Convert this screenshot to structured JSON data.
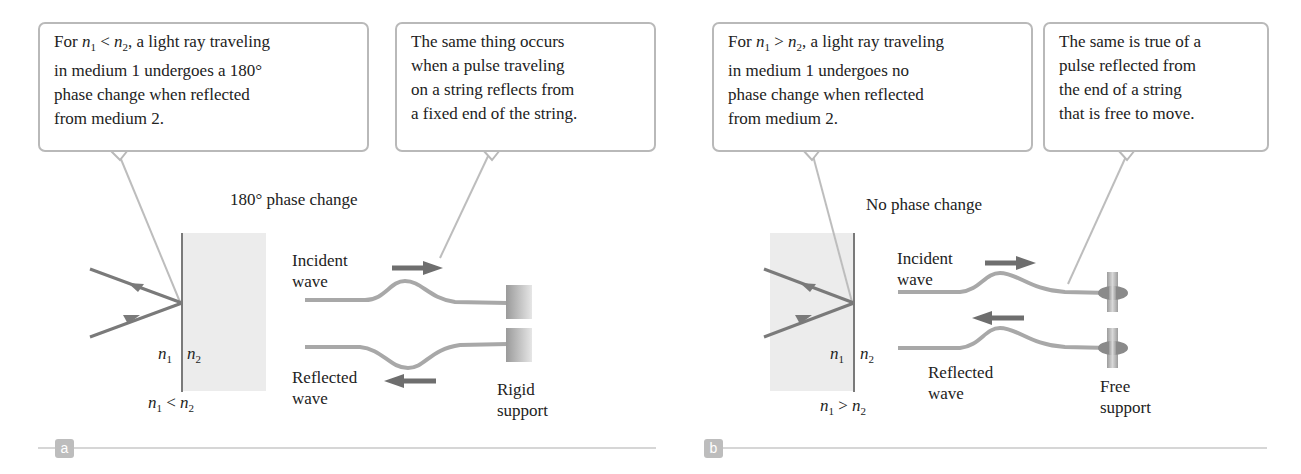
{
  "panel_a": {
    "badge": "a",
    "callout_light": {
      "lines": [
        {
          "pre": "For ",
          "n1": "n",
          "n1sub": "1",
          "op": " < ",
          "n2": "n",
          "n2sub": "2",
          "post": ", a light ray traveling"
        },
        "in medium 1 undergoes a 180°",
        "phase change when reflected",
        "from medium 2."
      ]
    },
    "callout_string": {
      "lines": [
        "The same thing occurs",
        "when a pulse traveling",
        "on a string reflects from",
        "a fixed end of the string."
      ]
    },
    "phase_label": "180° phase change",
    "incident_label": [
      "Incident",
      "wave"
    ],
    "reflected_label": [
      "Reflected",
      "wave"
    ],
    "support_label": [
      "Rigid",
      "support"
    ],
    "n_left": {
      "sym": "n",
      "sub": "1"
    },
    "n_right": {
      "sym": "n",
      "sub": "2"
    },
    "relation": {
      "a": "n",
      "asub": "1",
      "op": " < ",
      "b": "n",
      "bsub": "2"
    }
  },
  "panel_b": {
    "badge": "b",
    "callout_light": {
      "lines": [
        {
          "pre": "For ",
          "n1": "n",
          "n1sub": "1",
          "op": " > ",
          "n2": "n",
          "n2sub": "2",
          "post": ", a light ray traveling"
        },
        "in medium 1 undergoes no",
        "phase change when reflected",
        "from medium 2."
      ]
    },
    "callout_string": {
      "lines": [
        "The same is true of a",
        "pulse reflected from",
        "the end of a string",
        "that is free to move."
      ]
    },
    "phase_label": "No phase change",
    "incident_label": [
      "Incident",
      "wave"
    ],
    "reflected_label": [
      "Reflected",
      "wave"
    ],
    "support_label": [
      "Free",
      "support"
    ],
    "n_left": {
      "sym": "n",
      "sub": "1"
    },
    "n_right": {
      "sym": "n",
      "sub": "2"
    },
    "relation": {
      "a": "n",
      "asub": "1",
      "op": " > ",
      "b": "n",
      "bsub": "2"
    }
  },
  "colors": {
    "ray": "#7a7a7a",
    "leader": "#bdbdbd",
    "medium": "#ececec",
    "string": "#a8a8a8",
    "arrow": "#6e6e6e",
    "rule": "#c8c8c8",
    "badge": "#bdbdbd"
  }
}
